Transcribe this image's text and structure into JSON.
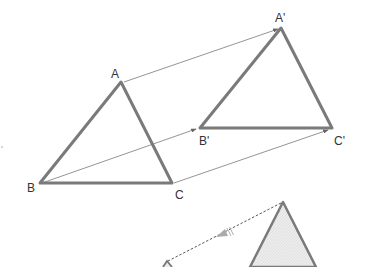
{
  "diagram": {
    "labels": {
      "A": "A",
      "B": "B",
      "C": "C",
      "A_prime": "A'",
      "B_prime": "B'",
      "C_prime": "C'"
    },
    "stray_mark": "'",
    "colors": {
      "triangle_edge": "#7a7a7a",
      "arrow": "#666666",
      "label": "#333333",
      "shaded_fill": "#e6e6e6"
    }
  }
}
